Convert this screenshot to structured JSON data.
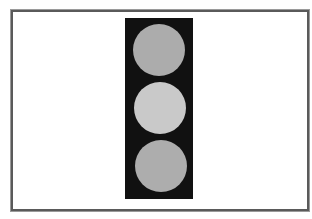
{
  "figure": {
    "frame_border_color": "#5a5a5a",
    "background_color": "#ffffff",
    "housing_color": "#111111"
  },
  "traffic_light": {
    "lamps": [
      {
        "position": "top",
        "state": "off",
        "color": "#acacac"
      },
      {
        "position": "middle",
        "state": "lit",
        "color": "#c9c9c9"
      },
      {
        "position": "bottom",
        "state": "off",
        "color": "#adadad"
      }
    ]
  }
}
